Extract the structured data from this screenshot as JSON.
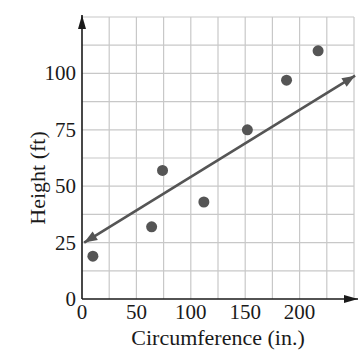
{
  "chart_data": {
    "type": "scatter",
    "title": "",
    "xlabel": "Circumference (in.)",
    "ylabel": "Height (ft)",
    "xlim": [
      0,
      250
    ],
    "ylim": [
      0,
      125
    ],
    "x_ticks": [
      0,
      50,
      100,
      150,
      200
    ],
    "y_ticks": [
      0,
      25,
      50,
      75,
      100
    ],
    "x_tick_labels": [
      "0",
      "50",
      "100",
      "150",
      "200"
    ],
    "y_tick_labels": [
      "0",
      "25",
      "50",
      "75",
      "100"
    ],
    "grid": true,
    "grid_step_x": 25,
    "grid_step_y": 12.5,
    "legend": null,
    "series": [
      {
        "name": "data points",
        "type": "scatter",
        "x": [
          10,
          64,
          74,
          112,
          152,
          188,
          217
        ],
        "y": [
          19,
          32,
          57,
          43,
          75,
          97,
          110
        ]
      },
      {
        "name": "line of fit",
        "type": "line",
        "x": [
          2,
          251
        ],
        "y": [
          25,
          99
        ],
        "arrows": "both"
      }
    ],
    "colors": {
      "points": "#555555",
      "line": "#555555",
      "grid": "#c8c8c8",
      "axes": "#1a1a1a"
    }
  }
}
